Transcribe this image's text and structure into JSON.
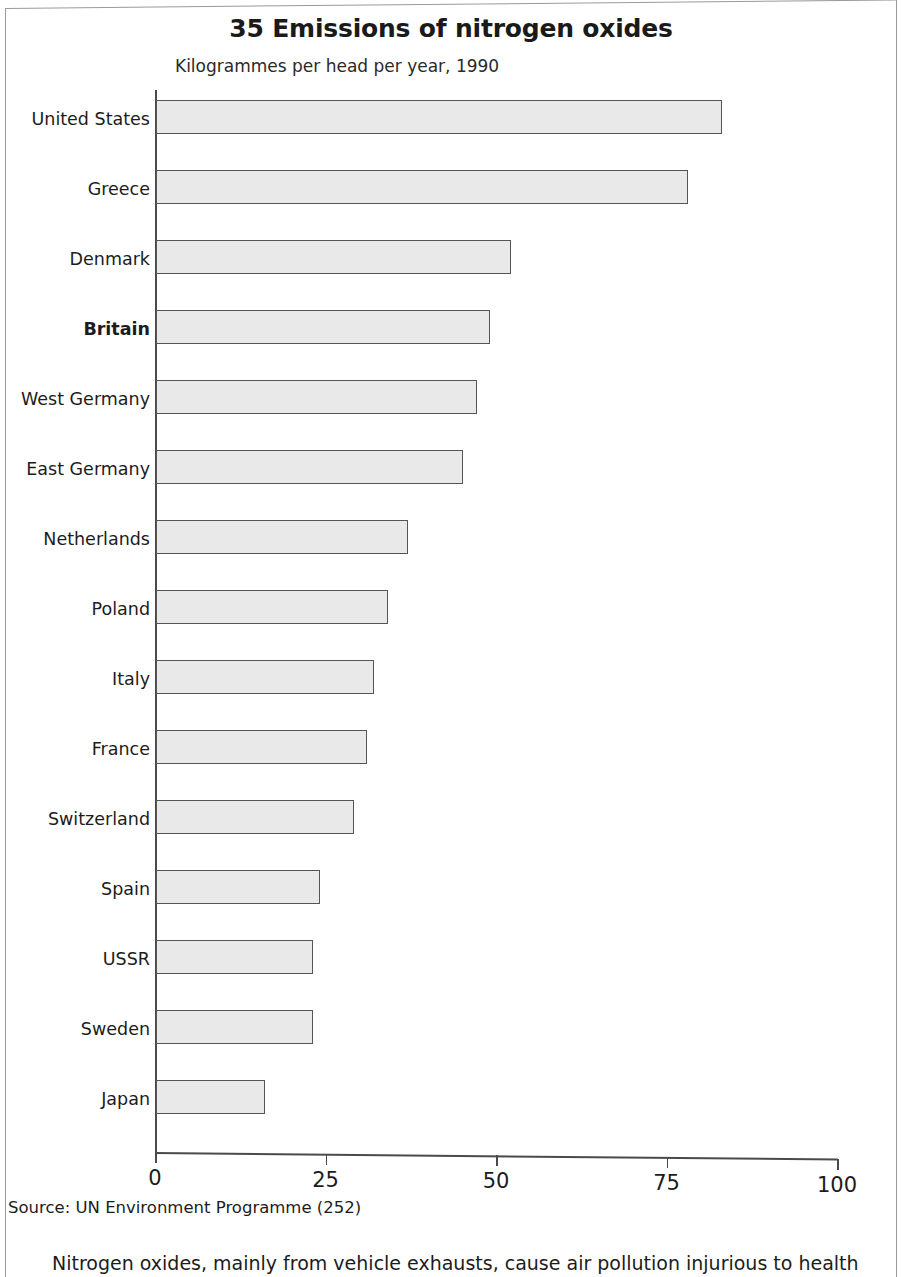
{
  "chart": {
    "title": "35 Emissions of nitrogen oxides",
    "subtitle": "Kilogrammes per head per year, 1990"
  },
  "source_note": "Source: UN Environment Programme (252)",
  "body_text": "Nitrogen oxides, mainly from vehicle exhausts, cause air pollution injurious to health",
  "colors": {
    "bar_fill": "#e9e9e9",
    "bar_border": "#555555",
    "axis": "#4a4a4a",
    "text": "#1c1c1c"
  },
  "chart_data": {
    "type": "bar",
    "orientation": "horizontal",
    "title": "35 Emissions of nitrogen oxides",
    "subtitle": "Kilogrammes per head per year, 1990",
    "xlabel": "",
    "ylabel": "",
    "xlim": [
      0,
      100
    ],
    "xticks": [
      0,
      25,
      50,
      75,
      100
    ],
    "xtick_labels": [
      "0",
      "25",
      "50",
      "75",
      "100"
    ],
    "grid": false,
    "legend": false,
    "highlight_category": "Britain",
    "categories": [
      "United States",
      "Greece",
      "Denmark",
      "Britain",
      "West Germany",
      "East Germany",
      "Netherlands",
      "Poland",
      "Italy",
      "France",
      "Switzerland",
      "Spain",
      "USSR",
      "Sweden",
      "Japan"
    ],
    "values": [
      83,
      78,
      52,
      49,
      47,
      45,
      37,
      34,
      32,
      31,
      29,
      24,
      23,
      23,
      16
    ]
  }
}
